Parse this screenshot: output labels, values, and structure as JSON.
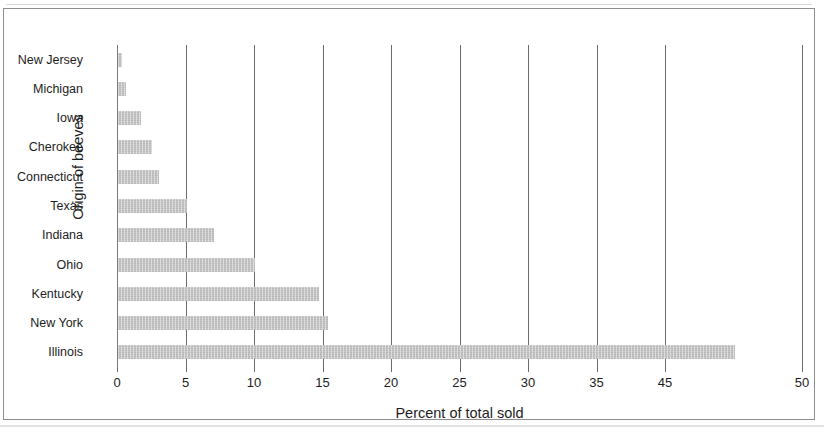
{
  "chart_data": {
    "type": "bar",
    "orientation": "horizontal",
    "title": "",
    "xlabel": "Percent of total sold",
    "ylabel": "Origin of beeves",
    "categories": [
      "New Jersey",
      "Michigan",
      "Iowa",
      "Cherokee",
      "Connecticut",
      "Texas",
      "Indiana",
      "Ohio",
      "Kentucky",
      "New York",
      "Illinois"
    ],
    "values": [
      0.3,
      0.6,
      1.7,
      2.5,
      3.0,
      5.0,
      7.0,
      10.0,
      14.7,
      15.3,
      45.0
    ],
    "xlim": [
      0,
      50
    ],
    "x_tick_labels": [
      "0",
      "5",
      "10",
      "15",
      "20",
      "25",
      "30",
      "35",
      "45",
      "50"
    ],
    "x_tick_values": [
      0,
      5,
      10,
      15,
      20,
      25,
      30,
      35,
      40,
      50
    ],
    "grid": "vertical",
    "legend": "none",
    "bar_color": "#c6c6c6",
    "gridline_color": "#6b6b6b",
    "text_color": "#1d1d1d"
  }
}
